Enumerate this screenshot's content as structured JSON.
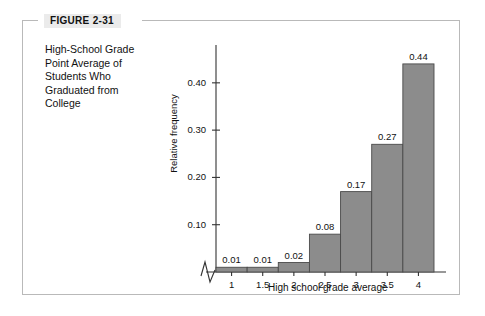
{
  "figure": {
    "tag": "FIGURE 2-31",
    "caption": "High-School Grade Point Average of Students Who Graduated from College"
  },
  "colors": {
    "bar_fill": "#8c8c8c",
    "bar_stroke": "#4a4a4a",
    "axis": "#333333",
    "frame": "#b9b9b9",
    "tag_background": "#ebebeb",
    "text": "#111111"
  },
  "chart_data": {
    "type": "bar",
    "title": "",
    "xlabel": "High school grade average",
    "ylabel": "Relative frequency",
    "categories": [
      "1",
      "1.5",
      "2",
      "2.5",
      "3",
      "3.5",
      "4"
    ],
    "values": [
      0.01,
      0.01,
      0.02,
      0.08,
      0.17,
      0.27,
      0.44
    ],
    "value_labels": [
      "0.01",
      "0.01",
      "0.02",
      "0.08",
      "0.17",
      "0.27",
      "0.44"
    ],
    "ytick_labels": [
      "0.10",
      "0.20",
      "0.30",
      "0.40"
    ],
    "ytick_values": [
      0.1,
      0.2,
      0.3,
      0.4
    ],
    "ylim": [
      0,
      0.48
    ],
    "grid": false,
    "legend": null,
    "axis_break": "x-axis zigzag break at origin"
  }
}
